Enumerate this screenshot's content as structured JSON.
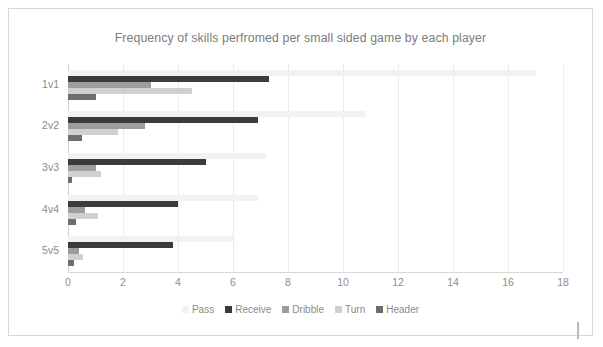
{
  "chart_data": {
    "type": "bar",
    "orientation": "horizontal",
    "title": "Frequency of skills perfromed per small sided game by each player",
    "xlabel": "",
    "ylabel": "",
    "categories": [
      "1v1",
      "2v2",
      "3v3",
      "4v4",
      "5v5"
    ],
    "xlim": [
      0,
      18
    ],
    "xticks": [
      0,
      2,
      4,
      6,
      8,
      10,
      12,
      14,
      16,
      18
    ],
    "grid": true,
    "legend_position": "bottom",
    "series": [
      {
        "name": "Pass",
        "color": "#f2f2f2",
        "values": [
          17.0,
          10.8,
          7.2,
          6.9,
          6.0
        ]
      },
      {
        "name": "Receive",
        "color": "#3b3b3b",
        "values": [
          7.3,
          6.9,
          5.0,
          4.0,
          3.8
        ]
      },
      {
        "name": "Dribble",
        "color": "#9d9d9d",
        "values": [
          3.0,
          2.8,
          1.0,
          0.6,
          0.4
        ]
      },
      {
        "name": "Turn",
        "color": "#d0d0d0",
        "values": [
          4.5,
          1.8,
          1.2,
          1.1,
          0.55
        ]
      },
      {
        "name": "Header",
        "color": "#6e6e6e",
        "values": [
          1.0,
          0.5,
          0.15,
          0.3,
          0.2
        ]
      }
    ]
  },
  "legend": {
    "items": [
      {
        "label": "Pass"
      },
      {
        "label": "Receive"
      },
      {
        "label": "Dribble"
      },
      {
        "label": "Turn"
      },
      {
        "label": "Header"
      }
    ]
  }
}
